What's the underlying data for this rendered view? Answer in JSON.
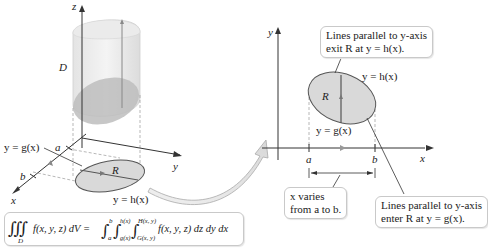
{
  "left_panel": {
    "axes": {
      "z": "z",
      "y": "y",
      "x": "x"
    },
    "solid_label": "D",
    "region_label": "R",
    "bounds": {
      "a": "a",
      "b": "b"
    },
    "lower_curve": "y = g(x)",
    "upper_curve": "y = h(x)"
  },
  "formula": {
    "lhs_integral": "∭",
    "lhs_domain": "D",
    "lhs_integrand": "f(x, y, z) dV =",
    "outer_lower": "a",
    "outer_upper": "b",
    "middle_lower": "g(x)",
    "middle_upper": "h(x)",
    "inner_lower": "G(x, y)",
    "inner_upper": "H(x, y)",
    "rhs_integrand": "f(x, y, z) dz dy dx"
  },
  "right_panel": {
    "axes": {
      "y": "y",
      "x": "x"
    },
    "region_label": "R",
    "upper_curve": "y = h(x)",
    "lower_curve": "y = g(x)",
    "bounds": {
      "a": "a",
      "b": "b"
    },
    "callout_exit": {
      "line1": "Lines parallel to y-axis",
      "line2": "exit R at y = h(x)."
    },
    "callout_enter": {
      "line1": "Lines parallel to y-axis",
      "line2": "enter R at y = g(x)."
    },
    "callout_x_range": {
      "line1": "x varies",
      "line2": "from a to b."
    }
  },
  "colors": {
    "region_fill": "#d9d9d9",
    "solid_fill": "#ececec",
    "axis": "#333333",
    "callout_border": "#c9c9c9"
  }
}
